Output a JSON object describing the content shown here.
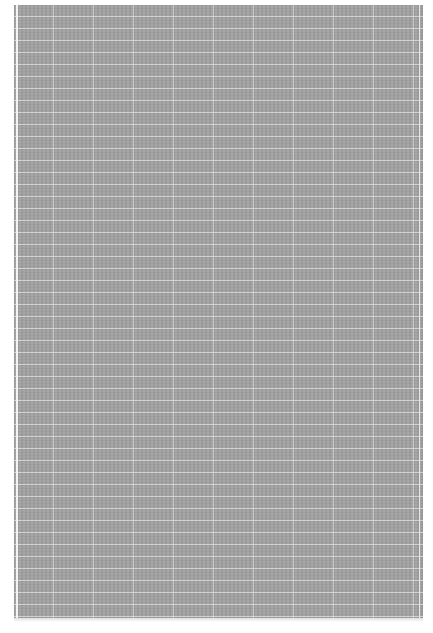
{
  "page": {
    "background_color": "#ffffff",
    "panel_color": "#a3a3a3",
    "grid_line_color": "#f0f0f0"
  }
}
